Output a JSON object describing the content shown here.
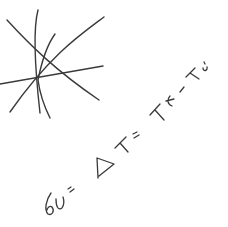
{
  "sketch": {
    "description": "Handwritten sketch on white paper",
    "ink_color": "#3a3a3a",
    "background": "#ffffff",
    "figure": {
      "name": "star of crossing lines",
      "line_count": 5
    },
    "equation": {
      "text": "60 = ΔT = Tf − Ti",
      "parts": [
        "60",
        "=",
        "ΔT",
        "=",
        "Tf",
        "−",
        "Ti"
      ],
      "rotation_deg": -35
    }
  }
}
